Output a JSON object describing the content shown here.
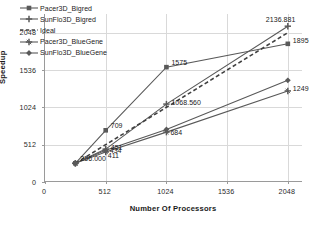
{
  "chart_data": {
    "type": "line",
    "title": "",
    "xlabel": "Number Of Processors",
    "ylabel": "Speedup",
    "xlim": [
      0,
      2176
    ],
    "ylim": [
      0,
      2304
    ],
    "xticks": [
      "0",
      "512",
      "1024",
      "1536",
      "2048"
    ],
    "yticks": [
      "0",
      "512",
      "1024",
      "1536",
      "2048"
    ],
    "xtick_values": [
      0,
      512,
      1024,
      1536,
      2048
    ],
    "ytick_values": [
      0,
      512,
      1024,
      1536,
      2048
    ],
    "grid": "horizontal-and-vertical",
    "legend_position": "upper-left-inside",
    "x": [
      256,
      512,
      1024,
      2048
    ],
    "series": [
      {
        "name": "Pacer3D_Bigred",
        "marker": "square",
        "linestyle": "solid",
        "color": "#595959",
        "values": [
          256.0,
          709,
          1575,
          1895
        ]
      },
      {
        "name": "SunFlo3D_Bigred",
        "marker": "plus",
        "linestyle": "solid",
        "color": "#595959",
        "values": [
          256.0,
          451,
          1068.56,
          2136.881
        ]
      },
      {
        "name": "Ideal",
        "marker": "none",
        "linestyle": "dashed",
        "color": "#404040",
        "values": [
          256.0,
          512,
          1024,
          2048
        ]
      },
      {
        "name": "Pacer3D_BlueGene",
        "marker": "cross",
        "linestyle": "solid",
        "color": "#595959",
        "values": [
          256.0,
          411,
          684,
          1249
        ]
      },
      {
        "name": "SunFlo3D_BlueGene",
        "marker": "diamond",
        "linestyle": "solid",
        "color": "#595959",
        "values": [
          256.0,
          434,
          720,
          1395
        ]
      }
    ],
    "point_labels": [
      {
        "text": "256.000",
        "x": 256,
        "y": 256.0
      },
      {
        "text": "709",
        "x": 512,
        "y": 709
      },
      {
        "text": "451",
        "x": 512,
        "y": 451
      },
      {
        "text": "434",
        "x": 512,
        "y": 434
      },
      {
        "text": "411",
        "x": 512,
        "y": 411
      },
      {
        "text": "1575",
        "x": 1024,
        "y": 1575
      },
      {
        "text": "1068.560",
        "x": 1024,
        "y": 1068.56
      },
      {
        "text": "684",
        "x": 1024,
        "y": 684
      },
      {
        "text": "2136.881",
        "x": 2048,
        "y": 2136.881
      },
      {
        "text": "1895",
        "x": 2048,
        "y": 1895
      },
      {
        "text": "1249",
        "x": 2048,
        "y": 1249
      }
    ]
  },
  "legend": {
    "items": [
      {
        "label": "Pacer3D_Bigred"
      },
      {
        "label": "SunFlo3D_Bigred"
      },
      {
        "label": "Ideal"
      },
      {
        "label": "Pacer3D_BlueGene"
      },
      {
        "label": "SunFlo3D_BlueGene"
      }
    ]
  },
  "axes": {
    "x_title": "Number Of Processors",
    "y_title": "Speedup",
    "x_ticks": [
      "0",
      "512",
      "1024",
      "1536",
      "2048"
    ],
    "y_ticks": [
      "0",
      "512",
      "1024",
      "1536",
      "2048"
    ]
  },
  "point_label_text": {
    "p0": "256.000",
    "p1": "709",
    "p2": "451",
    "p3": "434",
    "p4": "411",
    "p5": "1575",
    "p6": "1068.560",
    "p7": "684",
    "p8": "2136.881",
    "p9": "1895",
    "p10": "1249"
  }
}
